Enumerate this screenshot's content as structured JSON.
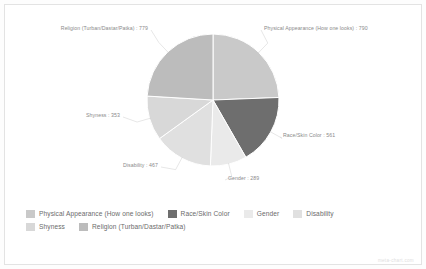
{
  "chart_data": {
    "type": "pie",
    "title": "",
    "categories": [
      "Physical Appearance (How one looks)",
      "Race/Skin Color",
      "Gender",
      "Disability",
      "Shyness",
      "Religion (Turban/Dastar/Patka)"
    ],
    "values": [
      790,
      561,
      289,
      467,
      353,
      779
    ],
    "total": 3239,
    "colors": [
      "#c9c9c9",
      "#6e6e6e",
      "#eaeaea",
      "#e0e0e0",
      "#d8d8d8",
      "#bcbcbc"
    ],
    "legend_position": "bottom",
    "grid": false,
    "slice_labels": [
      {
        "text": "Physical Appearance (How one looks) : 790",
        "category": "Physical Appearance (How one looks)",
        "value": 790
      },
      {
        "text": "Race/Skin Color : 561",
        "category": "Race/Skin Color",
        "value": 561
      },
      {
        "text": "Gender : 289",
        "category": "Gender",
        "value": 289
      },
      {
        "text": "Disability : 467",
        "category": "Disability",
        "value": 467
      },
      {
        "text": "Shyness : 353",
        "category": "Shyness",
        "value": 353
      },
      {
        "text": "Religion (Turban/Dastar/Patka) : 779",
        "category": "Religion (Turban/Dastar/Patka)",
        "value": 779
      }
    ]
  },
  "legend": {
    "entries": [
      {
        "label": "Physical Appearance (How one looks)",
        "color": "#c9c9c9"
      },
      {
        "label": "Race/Skin Color",
        "color": "#6e6e6e"
      },
      {
        "label": "Gender",
        "color": "#eaeaea"
      },
      {
        "label": "Disability",
        "color": "#e0e0e0"
      },
      {
        "label": "Shyness",
        "color": "#d8d8d8"
      },
      {
        "label": "Religion (Turban/Dastar/Patka)",
        "color": "#bcbcbc"
      }
    ]
  },
  "watermark": {
    "text": "meta-chart.com"
  }
}
